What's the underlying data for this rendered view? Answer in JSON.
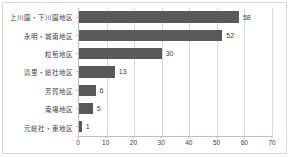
{
  "chart_data": {
    "type": "bar",
    "orientation": "horizontal",
    "title": "",
    "xlabel": "",
    "ylabel": "",
    "categories": [
      "上川園・下川園地区",
      "永明・城南地区",
      "粒萄地区",
      "清里・総社地区",
      "芳賀地区",
      "南場地区",
      "元総社・東地区"
    ],
    "values": [
      58,
      52,
      30,
      13,
      6,
      5,
      1
    ],
    "value_labels": [
      "58",
      "52",
      "30",
      "13",
      "6",
      "5",
      "1"
    ],
    "xlim": [
      0,
      70
    ],
    "xticks": [
      0,
      10,
      20,
      30,
      40,
      50,
      60,
      70
    ],
    "xtick_labels": [
      "0",
      "10",
      "20",
      "30",
      "40",
      "50",
      "60",
      "70"
    ],
    "grid": true,
    "grid_axis": "x",
    "legend": false,
    "bar_color": "#595959",
    "grid_color": "#d9d9d9",
    "axis_color": "#bfbfbf",
    "text_color": "#404040",
    "background_color": "#ffffff",
    "border_color": "#d9d9d9"
  }
}
